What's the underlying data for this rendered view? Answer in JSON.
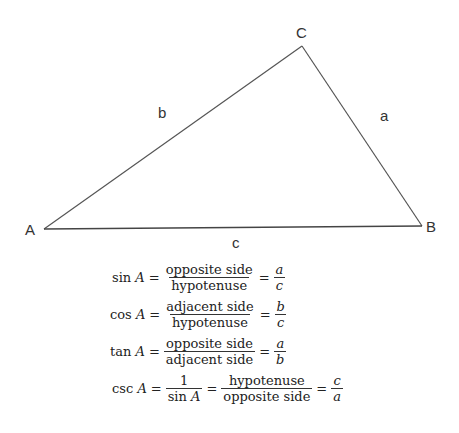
{
  "triangle": {
    "vertices": {
      "A": {
        "label": "A",
        "x": 44,
        "y": 229
      },
      "B": {
        "label": "B",
        "x": 422,
        "y": 226
      },
      "C": {
        "label": "C",
        "x": 302,
        "y": 46
      }
    },
    "sides": {
      "a": {
        "label": "a"
      },
      "b": {
        "label": "b"
      },
      "c": {
        "label": "c"
      }
    },
    "stroke_color": "#555555"
  },
  "formulas": [
    {
      "fn": "sin",
      "var": "A",
      "num1": "opposite side",
      "den1": "hypotenuse",
      "num2": "a",
      "den2": "c"
    },
    {
      "fn": "cos",
      "var": "A",
      "num1": "adjacent side",
      "den1": "hypotenuse",
      "num2": "b",
      "den2": "c"
    },
    {
      "fn": "tan",
      "var": "A",
      "num1": "opposite side",
      "den1": "adjacent side",
      "num2": "a",
      "den2": "b"
    },
    {
      "fn": "csc",
      "var": "A",
      "num0": "1",
      "den0fn": "sin",
      "den0var": "A",
      "num1": "hypotenuse",
      "den1": "opposite side",
      "num2": "c",
      "den2": "a"
    }
  ],
  "symbols": {
    "equals": "="
  }
}
